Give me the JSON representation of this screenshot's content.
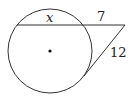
{
  "diagram": {
    "type": "circle-secant-tangent",
    "circle": {
      "cx": 50,
      "cy": 51,
      "r": 42,
      "center_dot": true
    },
    "external_point": {
      "x": 125,
      "y": 25
    },
    "secant": {
      "entry": {
        "x": 17,
        "y": 25
      },
      "exit": {
        "x": 84,
        "y": 25
      }
    },
    "tangent_point": {
      "x": 84,
      "y": 76
    },
    "labels": {
      "chord": "x",
      "external_segment": "7",
      "tangent": "12"
    },
    "colors": {
      "stroke": "#333333",
      "background": "#ffffff"
    }
  }
}
